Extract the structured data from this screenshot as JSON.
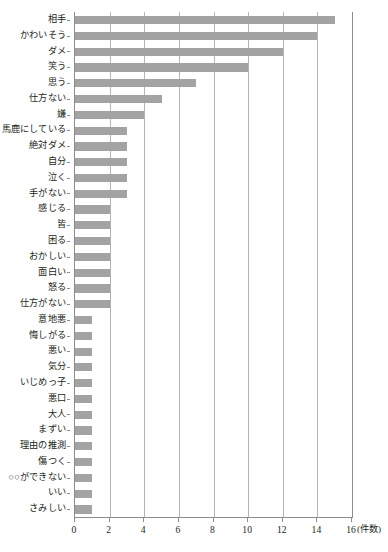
{
  "chart_data": {
    "type": "bar",
    "orientation": "horizontal",
    "title": "",
    "subtitle": "",
    "xlabel": "(件数)",
    "ylabel": "",
    "xlim": [
      0,
      16
    ],
    "ylim": null,
    "grid": true,
    "legend": null,
    "legend_position": "none",
    "bar_color": "#a3a3a3",
    "axis_color": "#8c8c8c",
    "grid_color": "#b5b5b5",
    "xticks": [
      0,
      2,
      4,
      6,
      8,
      10,
      12,
      14,
      16
    ],
    "xtick_labels": [
      "0",
      "2",
      "4",
      "6",
      "8",
      "10",
      "12",
      "14",
      "16"
    ],
    "unit_label": "(件数)",
    "categories": [
      "相手",
      "かわいそう",
      "ダメ",
      "笑う",
      "思う",
      "仕方ない",
      "嫌",
      "馬鹿にしている",
      "絶対ダメ",
      "自分",
      "泣く",
      "手がない",
      "感じる",
      "皆",
      "困る",
      "おかしい",
      "面白い",
      "怒る",
      "仕方がない",
      "意地悪",
      "悔しがる",
      "悪い",
      "気分",
      "いじめっ子",
      "悪口",
      "大人",
      "まずい",
      "理由の推測",
      "傷つく",
      "○○ができない",
      "いい",
      "さみしい"
    ],
    "values": [
      15,
      14,
      12,
      10,
      7,
      5,
      4,
      3,
      3,
      3,
      3,
      3,
      2,
      2,
      2,
      2,
      2,
      2,
      2,
      1,
      1,
      1,
      1,
      1,
      1,
      1,
      1,
      1,
      1,
      1,
      1,
      1
    ]
  }
}
